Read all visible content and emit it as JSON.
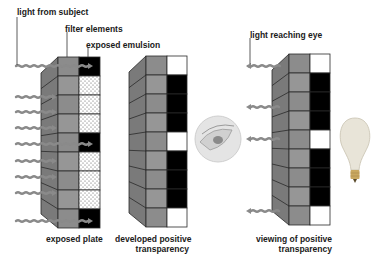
{
  "labels": {
    "light_from_subject": "light from subject",
    "filter_elements": "filter elements",
    "exposed_emulsion": "exposed emulsion",
    "light_reaching_eye": "light reaching eye",
    "exposed_plate": "exposed plate",
    "developed_positive_1": "developed positive",
    "developed_positive_2": "transparency",
    "viewing_positive_1": "viewing of positive",
    "viewing_positive_2": "transparency"
  },
  "panels": [
    {
      "name": "exposed-plate",
      "cells": [
        "black",
        "dots",
        "dots",
        "dots",
        "black",
        "dots",
        "dots",
        "dots",
        "black"
      ]
    },
    {
      "name": "developed-positive-transparency",
      "cells": [
        "white",
        "black",
        "black",
        "black",
        "white",
        "black",
        "black",
        "black",
        "white"
      ]
    },
    {
      "name": "viewing-of-positive-transparency",
      "cells": [
        "white",
        "black",
        "black",
        "black",
        "white",
        "black",
        "black",
        "black",
        "white"
      ]
    }
  ],
  "colors": {
    "filter_face": "#8f8f8f",
    "filter_side": "#7a7a7a",
    "arrow": "#8a8a8a",
    "black": "#000000",
    "outline": "#2a2a2a"
  }
}
